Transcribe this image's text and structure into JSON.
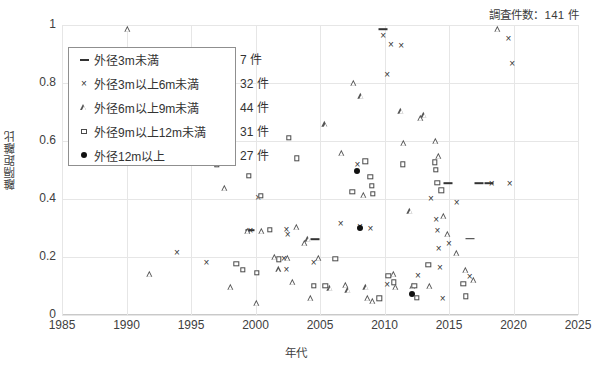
{
  "header": {
    "survey_count_text": "調査件数：141 件"
  },
  "legend": {
    "entries": [
      {
        "marker": "dash-marker",
        "label": "外径3m未満",
        "count": "7 件"
      },
      {
        "marker": "cross-marker",
        "label": "外径3m以上6m未満",
        "count": "32 件"
      },
      {
        "marker": "triangle-marker",
        "label": "外径6m以上9m未満",
        "count": "44 件"
      },
      {
        "marker": "square-marker",
        "label": "外径9m以上12m未満",
        "count": "31 件"
      },
      {
        "marker": "dot-marker",
        "label": "外径12m以上",
        "count": "27 件"
      }
    ]
  },
  "axes": {
    "x_title": "年代",
    "y_title": "離隔距離比",
    "x_ticks": [
      "1985",
      "1990",
      "1995",
      "2000",
      "2005",
      "2010",
      "2015",
      "2020",
      "2025"
    ],
    "y_ticks": [
      "0",
      "0.2",
      "0.4",
      "0.6",
      "0.8",
      "1"
    ]
  },
  "chart_data": {
    "type": "scatter",
    "title": "調査件数：141 件",
    "xlabel": "年代",
    "ylabel": "離隔距離比",
    "xlim": [
      1985,
      2025
    ],
    "ylim": [
      0,
      1
    ],
    "xticks": [
      1985,
      1990,
      1995,
      2000,
      2005,
      2010,
      2015,
      2020,
      2025
    ],
    "yticks": [
      0,
      0.2,
      0.4,
      0.6,
      0.8,
      1.0
    ],
    "grid": true,
    "legend_position": "upper-left-inside",
    "total_points": 141,
    "series": [
      {
        "name": "外径3m未満",
        "count": 7,
        "marker": "dash",
        "color": "#333333",
        "points": [
          [
            1999.6,
            0.293
          ],
          [
            2004.6,
            0.262
          ],
          [
            2009.9,
            0.985
          ],
          [
            2014.9,
            0.455
          ],
          [
            2016.6,
            0.263
          ],
          [
            2017.3,
            0.455
          ],
          [
            2018.1,
            0.455
          ]
        ]
      },
      {
        "name": "外径3m以上6m未満",
        "count": 32,
        "marker": "cross",
        "color": "#333333",
        "points": [
          [
            1993.9,
            0.218
          ],
          [
            1996.2,
            0.183
          ],
          [
            1999.6,
            0.292
          ],
          [
            2000.2,
            0.407
          ],
          [
            2002.2,
            0.196
          ],
          [
            2002.4,
            0.295
          ],
          [
            2002.5,
            0.278
          ],
          [
            2002.4,
            0.16
          ],
          [
            2004.5,
            0.182
          ],
          [
            2006.6,
            0.317
          ],
          [
            2007.9,
            0.52
          ],
          [
            2008.1,
            0.306
          ],
          [
            2008.9,
            0.3
          ],
          [
            2009.9,
            0.967
          ],
          [
            2010.5,
            0.935
          ],
          [
            2011.3,
            0.93
          ],
          [
            2010.2,
            0.83
          ],
          [
            2010.2,
            0.108
          ],
          [
            2012.6,
            0.137
          ],
          [
            2013.6,
            0.403
          ],
          [
            2014.0,
            0.33
          ],
          [
            2014.1,
            0.292
          ],
          [
            2014.2,
            0.23
          ],
          [
            2014.3,
            0.165
          ],
          [
            2014.5,
            0.058
          ],
          [
            2015.0,
            0.247
          ],
          [
            2015.6,
            0.39
          ],
          [
            2016.6,
            0.134
          ],
          [
            2018.3,
            0.455
          ],
          [
            2019.6,
            0.955
          ],
          [
            2019.9,
            0.87
          ],
          [
            2019.7,
            0.455
          ]
        ]
      },
      {
        "name": "外径6m以上9m未満",
        "count": 44,
        "marker": "triangle",
        "color": "#555555",
        "points": [
          [
            1990.1,
            0.985
          ],
          [
            1991.8,
            0.14
          ],
          [
            1997.6,
            0.437
          ],
          [
            1998.1,
            0.098
          ],
          [
            1999.4,
            0.289
          ],
          [
            2000.1,
            0.042
          ],
          [
            2000.5,
            0.29
          ],
          [
            2001.5,
            0.2
          ],
          [
            2001.8,
            0.157
          ],
          [
            2002.5,
            0.196
          ],
          [
            2002.9,
            0.115
          ],
          [
            2003.2,
            0.303
          ],
          [
            2003.8,
            0.247
          ],
          [
            2004.1,
            0.262
          ],
          [
            2004.3,
            0.059
          ],
          [
            2004.9,
            0.196
          ],
          [
            2005.4,
            0.657
          ],
          [
            2005.8,
            0.093
          ],
          [
            2006.7,
            0.56
          ],
          [
            2007.0,
            0.105
          ],
          [
            2007.2,
            0.085
          ],
          [
            2007.6,
            0.8
          ],
          [
            2008.2,
            0.755
          ],
          [
            2008.4,
            0.415
          ],
          [
            2008.6,
            0.098
          ],
          [
            2008.7,
            0.058
          ],
          [
            2009.1,
            0.05
          ],
          [
            2010.7,
            0.14
          ],
          [
            2010.9,
            0.096
          ],
          [
            2011.3,
            0.705
          ],
          [
            2011.5,
            0.592
          ],
          [
            2012.0,
            0.36
          ],
          [
            2012.2,
            0.1
          ],
          [
            2012.8,
            0.68
          ],
          [
            2013.1,
            0.69
          ],
          [
            2013.5,
            0.1
          ],
          [
            2014.0,
            0.6
          ],
          [
            2014.2,
            0.55
          ],
          [
            2014.6,
            0.34
          ],
          [
            2014.9,
            0.28
          ],
          [
            2015.6,
            0.215
          ],
          [
            2016.3,
            0.155
          ],
          [
            2016.9,
            0.12
          ],
          [
            2018.8,
            0.985
          ]
        ]
      },
      {
        "name": "外径9m以上12m未満",
        "count": 31,
        "marker": "square",
        "color": "#4a4a4a",
        "points": [
          [
            1997.0,
            0.518
          ],
          [
            1998.5,
            0.177
          ],
          [
            1999.0,
            0.155
          ],
          [
            1999.5,
            0.48
          ],
          [
            2000.1,
            0.145
          ],
          [
            2000.4,
            0.412
          ],
          [
            2001.1,
            0.294
          ],
          [
            2001.8,
            0.192
          ],
          [
            2002.6,
            0.61
          ],
          [
            2003.2,
            0.54
          ],
          [
            2004.5,
            0.1
          ],
          [
            2005.4,
            0.1
          ],
          [
            2006.2,
            0.193
          ],
          [
            2007.5,
            0.425
          ],
          [
            2008.5,
            0.53
          ],
          [
            2008.9,
            0.477
          ],
          [
            2009.0,
            0.445
          ],
          [
            2009.1,
            0.418
          ],
          [
            2009.6,
            0.058
          ],
          [
            2010.3,
            0.136
          ],
          [
            2010.7,
            0.113
          ],
          [
            2011.4,
            0.52
          ],
          [
            2012.3,
            0.1
          ],
          [
            2012.5,
            0.06
          ],
          [
            2013.4,
            0.173
          ],
          [
            2013.9,
            0.527
          ],
          [
            2014.0,
            0.5
          ],
          [
            2014.1,
            0.455
          ],
          [
            2014.4,
            0.43
          ],
          [
            2016.1,
            0.108
          ],
          [
            2016.3,
            0.065
          ]
        ]
      },
      {
        "name": "外径12m以上",
        "count": 27,
        "marker": "dot",
        "color": "#111111",
        "points": [
          [
            2007.9,
            0.497
          ],
          [
            2008.1,
            0.3
          ],
          [
            2012.1,
            0.072
          ]
        ]
      }
    ]
  }
}
